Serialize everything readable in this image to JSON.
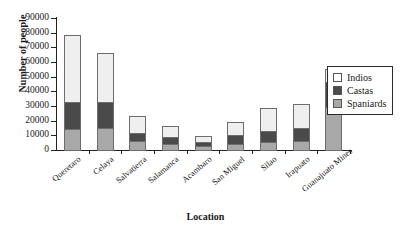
{
  "chart_data": {
    "type": "bar",
    "stacked": true,
    "title": "",
    "xlabel": "Location",
    "ylabel": "Number of people",
    "ylim": [
      0,
      90000
    ],
    "ytick_step": 10000,
    "yticks": [
      90000,
      80000,
      70000,
      60000,
      50000,
      40000,
      30000,
      20000,
      10000,
      0
    ],
    "grid": false,
    "legend_position": "right",
    "categories": [
      "Queretaro",
      "Celaya",
      "Salvatierra",
      "Salamanca",
      "Acambaro",
      "San Miguel",
      "Silao",
      "Irapuato",
      "Guanajuato Mines"
    ],
    "series": [
      {
        "name": "Spaniards",
        "color": "#a8a8a8",
        "values": [
          15000,
          15500,
          7000,
          5000,
          3500,
          5000,
          6000,
          6500,
          30000
        ]
      },
      {
        "name": "Castas",
        "color": "#4a4a4a",
        "values": [
          19000,
          18500,
          6000,
          5500,
          3000,
          6500,
          8000,
          10000,
          18000
        ]
      },
      {
        "name": "Indios",
        "color": "#efefef",
        "values": [
          46500,
          34000,
          12000,
          8000,
          5000,
          9500,
          17000,
          17000,
          9000
        ]
      }
    ],
    "totals": [
      80500,
      68000,
      25000,
      18500,
      11500,
      21000,
      31000,
      33500,
      57000
    ]
  },
  "legend": {
    "items": [
      {
        "label": "Indios",
        "color": "#ffffff"
      },
      {
        "label": "Castas",
        "color": "#4a4a4a"
      },
      {
        "label": "Spaniards",
        "color": "#a8a8a8"
      }
    ]
  }
}
